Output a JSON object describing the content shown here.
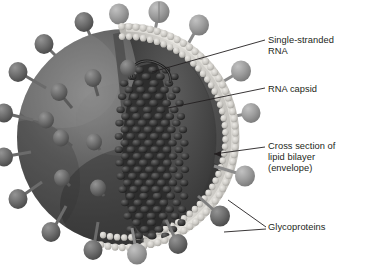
{
  "figure": {
    "background_color": "#ffffff",
    "text_color": "#231f20",
    "palette": {
      "envelope_body": "#5c5c5c",
      "envelope_body_dark": "#3a3a3a",
      "bilayer_light": "#d8d6d2",
      "bilayer_bead": "#cfcdc8",
      "interior_cavity": "#4a4a4a",
      "capsid_dark": "#2b2b2b",
      "spike_head": "#6e6e6e",
      "spike_head_light": "#9a9a9a",
      "spike_stalk": "#787878",
      "leader_line": "#231f20"
    }
  },
  "labels": {
    "single_stranded_rna": "Single-stranded\nRNA",
    "rna_capsid": "RNA capsid",
    "lipid_bilayer": "Cross section of\nlipid bilayer\n(envelope)",
    "glycoproteins": "Glycoproteins"
  },
  "parts": {
    "envelope": "viral envelope sphere",
    "cutaway": "quarter cutaway revealing interior",
    "bilayer_rim": "phospholipid bilayer rim with beaded head groups",
    "nucleocapsid": "helical ribonucleocapsid column",
    "rna_strand": "single-stranded RNA loop",
    "spikes": "glycoprotein surface spikes"
  }
}
